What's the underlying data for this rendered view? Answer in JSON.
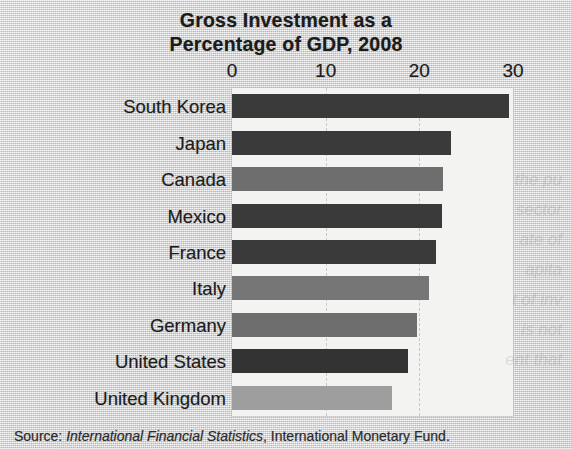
{
  "title": {
    "line1": "Gross Investment as a",
    "line2": "Percentage of GDP, 2008"
  },
  "source": {
    "prefix": "Source:",
    "italic_part": "International Financial Statistics",
    "suffix": ", International Monetary Fund."
  },
  "chart_data": {
    "type": "bar",
    "orientation": "horizontal",
    "title": "Gross Investment as a Percentage of GDP, 2008",
    "xlabel": "",
    "ylabel": "",
    "xlim": [
      0,
      30
    ],
    "ticks": [
      "0",
      "10",
      "20",
      "30"
    ],
    "tick_values": [
      0,
      10,
      20,
      30
    ],
    "grid": true,
    "grid_style": "dashed-vertical",
    "legend": "none",
    "categories": [
      "South Korea",
      "Japan",
      "Canada",
      "Mexico",
      "France",
      "Italy",
      "Germany",
      "United States",
      "United Kingdom"
    ],
    "values": [
      29.6,
      23.4,
      22.5,
      22.4,
      21.8,
      21.0,
      19.7,
      18.8,
      17.1
    ],
    "bar_colors": [
      "#3a3a3a",
      "#3a3a3a",
      "#6e6e6e",
      "#3a3a3a",
      "#3a3a3a",
      "#767676",
      "#6e6e6e",
      "#333333",
      "#9e9e9e"
    ],
    "panel_color": "#f3f3f1"
  },
  "ghost_text": [
    "the pu",
    "sector",
    "ate of",
    "apita",
    "t of inv",
    "is not",
    "ent that"
  ]
}
